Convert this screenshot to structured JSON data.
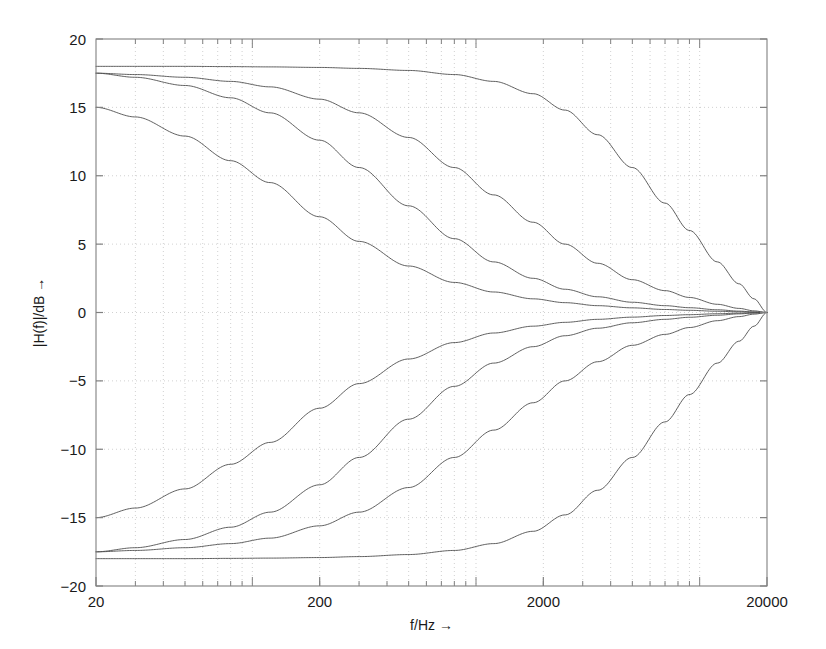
{
  "chart_data": {
    "type": "line",
    "title": "",
    "subtitle": "",
    "xlabel": "f/Hz →",
    "ylabel": "|H(f)|/dB →",
    "xscale": "log",
    "yscale": "linear",
    "xlim": [
      20,
      20000
    ],
    "ylim": [
      -20,
      20
    ],
    "xticks": [
      20,
      200,
      2000,
      20000
    ],
    "xtick_labels": [
      "20",
      "200",
      "2000",
      "20000"
    ],
    "yticks": [
      20,
      15,
      10,
      5,
      0,
      -5,
      -10,
      -15,
      -20
    ],
    "ytick_labels": [
      "20",
      "15",
      "10",
      "5",
      "0",
      "−5",
      "−10",
      "−15",
      "−20"
    ],
    "grid": true,
    "grid_style": "dotted",
    "grid_minor": true,
    "legend": "none",
    "line_color": "#4d4d4d",
    "grid_color": "#bdbdbd",
    "axis_color": "#808080",
    "background": "#ffffff",
    "annotations": [],
    "series": [
      {
        "name": "boost-18dB-fc-6000",
        "gain_db": 18.0,
        "corner_hz": 6000,
        "slope": "gentle",
        "points": [
          [
            20,
            18.0
          ],
          [
            30,
            18.0
          ],
          [
            50,
            18.0
          ],
          [
            80,
            17.98
          ],
          [
            120,
            17.96
          ],
          [
            200,
            17.92
          ],
          [
            300,
            17.85
          ],
          [
            500,
            17.7
          ],
          [
            800,
            17.4
          ],
          [
            1200,
            16.9
          ],
          [
            1800,
            16.0
          ],
          [
            2500,
            14.8
          ],
          [
            3500,
            13.0
          ],
          [
            5000,
            10.6
          ],
          [
            7000,
            8.0
          ],
          [
            9000,
            6.0
          ],
          [
            12000,
            3.7
          ],
          [
            15000,
            2.1
          ],
          [
            17500,
            1.0
          ],
          [
            20000,
            0.0
          ]
        ]
      },
      {
        "name": "boost-17p5dB-fc-900",
        "gain_db": 17.5,
        "corner_hz": 900,
        "slope": "medium",
        "points": [
          [
            20,
            17.5
          ],
          [
            30,
            17.4
          ],
          [
            50,
            17.2
          ],
          [
            80,
            16.9
          ],
          [
            120,
            16.5
          ],
          [
            200,
            15.6
          ],
          [
            300,
            14.6
          ],
          [
            500,
            12.8
          ],
          [
            800,
            10.6
          ],
          [
            1200,
            8.6
          ],
          [
            1800,
            6.6
          ],
          [
            2500,
            5.0
          ],
          [
            3500,
            3.6
          ],
          [
            5000,
            2.4
          ],
          [
            7000,
            1.6
          ],
          [
            9000,
            1.1
          ],
          [
            12000,
            0.6
          ],
          [
            15000,
            0.3
          ],
          [
            17500,
            0.12
          ],
          [
            20000,
            0.0
          ]
        ]
      },
      {
        "name": "boost-17p5dB-fc-300",
        "gain_db": 17.5,
        "corner_hz": 300,
        "slope": "steeper",
        "points": [
          [
            20,
            17.5
          ],
          [
            30,
            17.2
          ],
          [
            50,
            16.6
          ],
          [
            80,
            15.7
          ],
          [
            120,
            14.6
          ],
          [
            200,
            12.6
          ],
          [
            300,
            10.6
          ],
          [
            500,
            7.8
          ],
          [
            800,
            5.4
          ],
          [
            1200,
            3.7
          ],
          [
            1800,
            2.5
          ],
          [
            2500,
            1.7
          ],
          [
            3500,
            1.15
          ],
          [
            5000,
            0.75
          ],
          [
            7000,
            0.5
          ],
          [
            9000,
            0.35
          ],
          [
            12000,
            0.2
          ],
          [
            15000,
            0.1
          ],
          [
            17500,
            0.04
          ],
          [
            20000,
            0.0
          ]
        ]
      },
      {
        "name": "boost-15dB-fc-110",
        "gain_db": 15.0,
        "corner_hz": 110,
        "slope": "steepest",
        "points": [
          [
            20,
            15.0
          ],
          [
            30,
            14.3
          ],
          [
            50,
            12.9
          ],
          [
            80,
            11.1
          ],
          [
            120,
            9.5
          ],
          [
            200,
            7.0
          ],
          [
            300,
            5.2
          ],
          [
            500,
            3.4
          ],
          [
            800,
            2.2
          ],
          [
            1200,
            1.5
          ],
          [
            1800,
            1.0
          ],
          [
            2500,
            0.72
          ],
          [
            3500,
            0.5
          ],
          [
            5000,
            0.34
          ],
          [
            7000,
            0.22
          ],
          [
            9000,
            0.16
          ],
          [
            12000,
            0.09
          ],
          [
            15000,
            0.05
          ],
          [
            17500,
            0.02
          ],
          [
            20000,
            0.0
          ]
        ]
      },
      {
        "name": "cut-18dB-fc-6000",
        "gain_db": -18.0,
        "corner_hz": 6000,
        "slope": "gentle",
        "points": [
          [
            20,
            -18.0
          ],
          [
            30,
            -18.0
          ],
          [
            50,
            -18.0
          ],
          [
            80,
            -17.98
          ],
          [
            120,
            -17.96
          ],
          [
            200,
            -17.92
          ],
          [
            300,
            -17.85
          ],
          [
            500,
            -17.7
          ],
          [
            800,
            -17.4
          ],
          [
            1200,
            -16.9
          ],
          [
            1800,
            -16.0
          ],
          [
            2500,
            -14.8
          ],
          [
            3500,
            -13.0
          ],
          [
            5000,
            -10.6
          ],
          [
            7000,
            -8.0
          ],
          [
            9000,
            -6.0
          ],
          [
            12000,
            -3.7
          ],
          [
            15000,
            -2.1
          ],
          [
            17500,
            -1.0
          ],
          [
            20000,
            0.0
          ]
        ]
      },
      {
        "name": "cut-17p5dB-fc-900",
        "gain_db": -17.5,
        "corner_hz": 900,
        "slope": "medium",
        "points": [
          [
            20,
            -17.5
          ],
          [
            30,
            -17.4
          ],
          [
            50,
            -17.2
          ],
          [
            80,
            -16.9
          ],
          [
            120,
            -16.5
          ],
          [
            200,
            -15.6
          ],
          [
            300,
            -14.6
          ],
          [
            500,
            -12.8
          ],
          [
            800,
            -10.6
          ],
          [
            1200,
            -8.6
          ],
          [
            1800,
            -6.6
          ],
          [
            2500,
            -5.0
          ],
          [
            3500,
            -3.6
          ],
          [
            5000,
            -2.4
          ],
          [
            7000,
            -1.6
          ],
          [
            9000,
            -1.1
          ],
          [
            12000,
            -0.6
          ],
          [
            15000,
            -0.3
          ],
          [
            17500,
            -0.12
          ],
          [
            20000,
            0.0
          ]
        ]
      },
      {
        "name": "cut-17p5dB-fc-300",
        "gain_db": -17.5,
        "corner_hz": 300,
        "slope": "steeper",
        "points": [
          [
            20,
            -17.5
          ],
          [
            30,
            -17.2
          ],
          [
            50,
            -16.6
          ],
          [
            80,
            -15.7
          ],
          [
            120,
            -14.6
          ],
          [
            200,
            -12.6
          ],
          [
            300,
            -10.6
          ],
          [
            500,
            -7.8
          ],
          [
            800,
            -5.4
          ],
          [
            1200,
            -3.7
          ],
          [
            1800,
            -2.5
          ],
          [
            2500,
            -1.7
          ],
          [
            3500,
            -1.15
          ],
          [
            5000,
            -0.75
          ],
          [
            7000,
            -0.5
          ],
          [
            9000,
            -0.35
          ],
          [
            12000,
            -0.2
          ],
          [
            15000,
            -0.1
          ],
          [
            17500,
            -0.04
          ],
          [
            20000,
            0.0
          ]
        ]
      },
      {
        "name": "cut-15dB-fc-110",
        "gain_db": -15.0,
        "corner_hz": 110,
        "slope": "steepest",
        "points": [
          [
            20,
            -15.0
          ],
          [
            30,
            -14.3
          ],
          [
            50,
            -12.9
          ],
          [
            80,
            -11.1
          ],
          [
            120,
            -9.5
          ],
          [
            200,
            -7.0
          ],
          [
            300,
            -5.2
          ],
          [
            500,
            -3.4
          ],
          [
            800,
            -2.2
          ],
          [
            1200,
            -1.5
          ],
          [
            1800,
            -1.0
          ],
          [
            2500,
            -0.72
          ],
          [
            3500,
            -0.5
          ],
          [
            5000,
            -0.34
          ],
          [
            7000,
            -0.22
          ],
          [
            9000,
            -0.16
          ],
          [
            12000,
            -0.09
          ],
          [
            15000,
            -0.05
          ],
          [
            17500,
            -0.02
          ],
          [
            20000,
            0.0
          ]
        ]
      }
    ]
  }
}
